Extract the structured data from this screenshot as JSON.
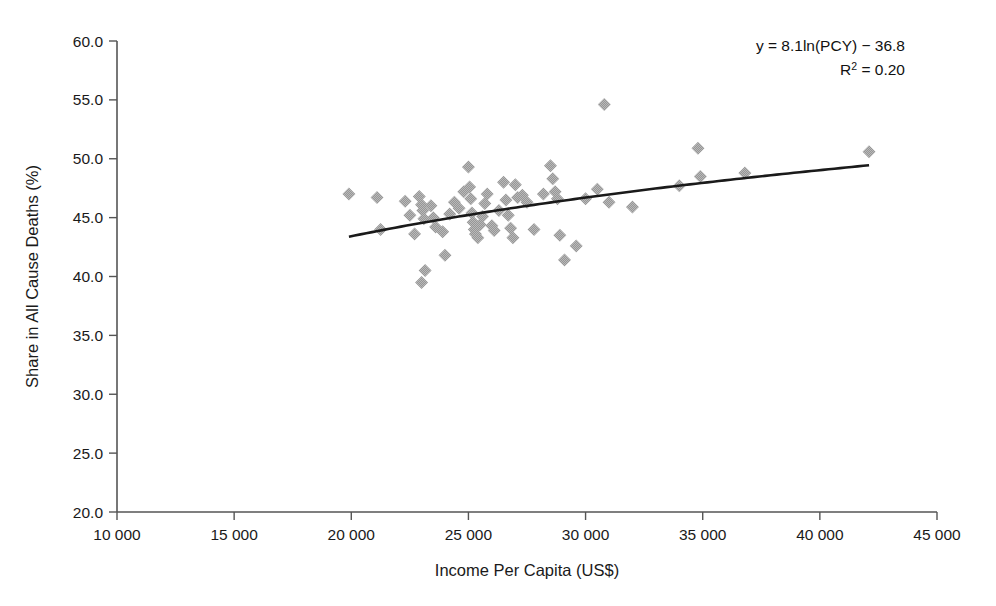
{
  "chart_data": {
    "type": "scatter",
    "title": "",
    "xlabel": "Income Per Capita (US$)",
    "ylabel": "Share in All Cause Deaths (%)",
    "xlim": [
      10000,
      45000
    ],
    "ylim": [
      20.0,
      60.0
    ],
    "xticks": [
      10000,
      15000,
      20000,
      25000,
      30000,
      35000,
      40000,
      45000
    ],
    "xtick_labels": [
      "10 000",
      "15 000",
      "20 000",
      "25 000",
      "30 000",
      "35 000",
      "40 000",
      "45 000"
    ],
    "yticks": [
      20.0,
      25.0,
      30.0,
      35.0,
      40.0,
      45.0,
      50.0,
      55.0,
      60.0
    ],
    "ytick_labels": [
      "20.0",
      "25.0",
      "30.0",
      "35.0",
      "40.0",
      "45.0",
      "50.0",
      "55.0",
      "60.0"
    ],
    "grid": false,
    "legend": null,
    "marker": {
      "shape": "diamond",
      "color": "#969696",
      "size": 13
    },
    "annotations": [
      {
        "name": "regression-equation",
        "text": "y = 8.1ln(PCY) − 36.8"
      },
      {
        "name": "r-squared",
        "text_prefix": "R",
        "text_sup": "2",
        "text_suffix": " = 0.20"
      }
    ],
    "trendline": {
      "type": "logarithmic",
      "equation": "y = 8.1ln(PCY) - 36.8",
      "r_squared": 0.2,
      "coefficient": 8.1,
      "intercept": -36.8,
      "color": "#1a1a1a",
      "x_start": 19900,
      "x_end": 42100
    },
    "points": [
      [
        19900,
        47.0
      ],
      [
        21100,
        46.7
      ],
      [
        21250,
        44.0
      ],
      [
        22300,
        46.4
      ],
      [
        22500,
        45.2
      ],
      [
        22700,
        43.6
      ],
      [
        22900,
        46.8
      ],
      [
        23000,
        46.1
      ],
      [
        23050,
        45.6
      ],
      [
        23100,
        44.9
      ],
      [
        23150,
        40.5
      ],
      [
        23000,
        39.5
      ],
      [
        23400,
        46.0
      ],
      [
        23500,
        45.0
      ],
      [
        23600,
        44.2
      ],
      [
        23900,
        43.8
      ],
      [
        24000,
        41.8
      ],
      [
        24200,
        45.3
      ],
      [
        24400,
        46.3
      ],
      [
        24600,
        45.8
      ],
      [
        24800,
        47.2
      ],
      [
        25000,
        49.3
      ],
      [
        25050,
        47.6
      ],
      [
        25100,
        46.6
      ],
      [
        25150,
        45.4
      ],
      [
        25200,
        44.6
      ],
      [
        25250,
        44.0
      ],
      [
        25300,
        43.6
      ],
      [
        25400,
        43.3
      ],
      [
        25500,
        44.4
      ],
      [
        25600,
        45.1
      ],
      [
        25700,
        46.2
      ],
      [
        25800,
        47.0
      ],
      [
        26000,
        44.3
      ],
      [
        26100,
        43.9
      ],
      [
        26300,
        45.6
      ],
      [
        26500,
        48.0
      ],
      [
        26600,
        46.5
      ],
      [
        26700,
        45.2
      ],
      [
        26800,
        44.1
      ],
      [
        26900,
        43.3
      ],
      [
        27000,
        47.8
      ],
      [
        27100,
        46.7
      ],
      [
        27300,
        46.9
      ],
      [
        27500,
        46.3
      ],
      [
        27800,
        44.0
      ],
      [
        28200,
        47.0
      ],
      [
        28500,
        49.4
      ],
      [
        28600,
        48.3
      ],
      [
        28700,
        47.2
      ],
      [
        28800,
        46.6
      ],
      [
        28900,
        43.5
      ],
      [
        29100,
        41.4
      ],
      [
        29600,
        42.6
      ],
      [
        30000,
        46.6
      ],
      [
        30500,
        47.4
      ],
      [
        30800,
        54.6
      ],
      [
        31000,
        46.3
      ],
      [
        32000,
        45.9
      ],
      [
        34000,
        47.7
      ],
      [
        34800,
        50.9
      ],
      [
        34900,
        48.5
      ],
      [
        36800,
        48.8
      ],
      [
        42100,
        50.6
      ]
    ]
  }
}
